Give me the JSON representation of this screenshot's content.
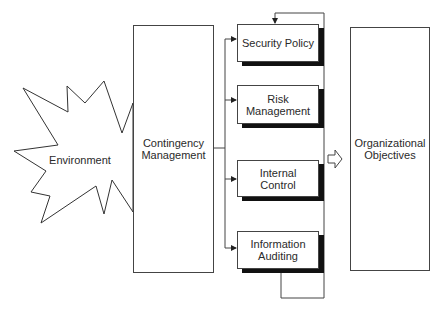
{
  "diagram": {
    "environment": {
      "label": "Environment"
    },
    "contingency": {
      "line1": "Contingency",
      "line2": "Management"
    },
    "components": [
      {
        "line1": "Security Policy",
        "line2": ""
      },
      {
        "line1": "Risk",
        "line2": "Management"
      },
      {
        "line1": "Internal",
        "line2": "Control"
      },
      {
        "line1": "Information",
        "line2": "Auditing"
      }
    ],
    "objectives": {
      "line1": "Organizational",
      "line2": "Objectives"
    },
    "colors": {
      "stroke": "#444444",
      "shadow": "#111111",
      "background": "#ffffff"
    }
  }
}
